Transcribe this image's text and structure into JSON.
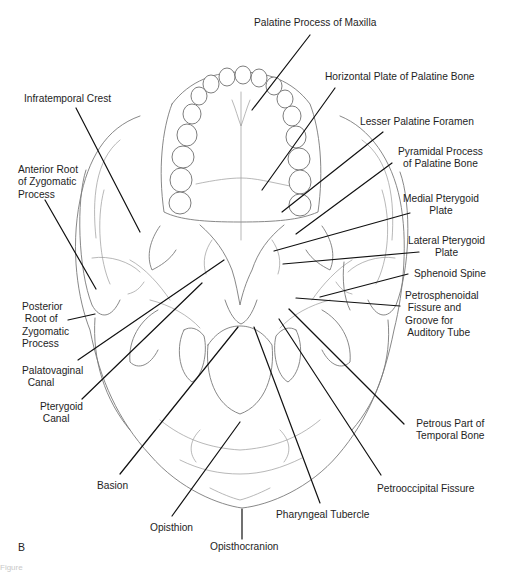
{
  "figure": {
    "panel_letter": "B",
    "view": "Inferior view of the skull (norma basalis)",
    "caption_fragment": "Figure"
  },
  "labels": [
    {
      "id": "palatine-process-of-maxilla",
      "text": "Palatine Process of Maxilla",
      "x": 254,
      "y": 17,
      "align": "left",
      "line": [
        310,
        35,
        252,
        110
      ]
    },
    {
      "id": "horizontal-plate-of-palatine-bone",
      "text": "Horizontal Plate of Palatine Bone",
      "x": 325,
      "y": 71,
      "align": "left",
      "line": [
        335,
        88,
        262,
        190
      ]
    },
    {
      "id": "infratemporal-crest",
      "text": "Infratemporal Crest",
      "x": 24,
      "y": 93,
      "align": "left",
      "line": [
        76,
        108,
        140,
        232
      ]
    },
    {
      "id": "lesser-palatine-foramen",
      "text": "Lesser Palatine Foramen",
      "x": 360,
      "y": 116,
      "align": "left",
      "line": [
        383,
        132,
        282,
        212
      ]
    },
    {
      "id": "pyramidal-process-of-palatine-bone",
      "text": "Pyramidal Process\nof Palatine Bone",
      "x": 398,
      "y": 146,
      "align": "center",
      "line": [
        392,
        163,
        296,
        234
      ]
    },
    {
      "id": "anterior-root-of-zygomatic-process",
      "text": "Anterior Root\nof Zygomatic\nProcess",
      "x": 18,
      "y": 164,
      "align": "left",
      "line": [
        45,
        200,
        96,
        289
      ]
    },
    {
      "id": "medial-pterygoid-plate",
      "text": "Medial Pterygoid\nPlate",
      "x": 403,
      "y": 193,
      "align": "center",
      "line": [
        410,
        213,
        274,
        251
      ]
    },
    {
      "id": "lateral-pterygoid-plate",
      "text": "Lateral Pterygoid\nPlate",
      "x": 408,
      "y": 235,
      "align": "center",
      "line": [
        419,
        252,
        283,
        264
      ]
    },
    {
      "id": "sphenoid-spine",
      "text": "Sphenoid Spine",
      "x": 414,
      "y": 268,
      "align": "left",
      "line": [
        408,
        274,
        320,
        297
      ]
    },
    {
      "id": "petrosphenoidal-fissure-and-groove-for-auditory-tube",
      "text": "Petrosphenoidal\n Fissure and\nGroove for\n Auditory Tube",
      "x": 405,
      "y": 290,
      "align": "left",
      "line": [
        400,
        306,
        296,
        298
      ]
    },
    {
      "id": "posterior-root-of-zygomatic-process",
      "text": "Posterior\n Root of\nZygomatic\nProcess",
      "x": 22,
      "y": 301,
      "align": "left",
      "line": [
        68,
        320,
        95,
        314
      ]
    },
    {
      "id": "palatovaginal-canal",
      "text": "Palatovaginal\n  Canal",
      "x": 22,
      "y": 365,
      "align": "left",
      "line": [
        78,
        360,
        224,
        260
      ]
    },
    {
      "id": "pterygoid-canal",
      "text": "Pterygoid\n Canal",
      "x": 40,
      "y": 401,
      "align": "left",
      "line": [
        82,
        399,
        202,
        283
      ]
    },
    {
      "id": "petrous-part-of-temporal-bone",
      "text": "Petrous Part of\nTemporal Bone",
      "x": 416,
      "y": 418,
      "align": "center",
      "line": [
        404,
        424,
        289,
        309
      ]
    },
    {
      "id": "basion",
      "text": "Basion",
      "x": 97,
      "y": 480,
      "align": "left",
      "line": [
        120,
        474,
        238,
        327
      ]
    },
    {
      "id": "petrooccipital-fissure",
      "text": "Petrooccipital Fissure",
      "x": 377,
      "y": 483,
      "align": "left",
      "line": [
        381,
        475,
        279,
        319
      ]
    },
    {
      "id": "opisthion",
      "text": "Opisthion",
      "x": 150,
      "y": 522,
      "align": "left",
      "line": [
        172,
        516,
        240,
        422
      ]
    },
    {
      "id": "pharyngeal-tubercle",
      "text": "Pharyngeal Tubercle",
      "x": 276,
      "y": 509,
      "align": "left",
      "line": [
        320,
        503,
        254,
        327
      ]
    },
    {
      "id": "opisthocranion",
      "text": "Opisthocranion",
      "x": 210,
      "y": 541,
      "align": "left",
      "line": [
        242,
        509,
        242,
        539
      ]
    }
  ],
  "colors": {
    "leader_line": "#111111",
    "bone_outline": "#7a7a7a",
    "label_text": "#1e1e1e",
    "background": "#ffffff"
  }
}
